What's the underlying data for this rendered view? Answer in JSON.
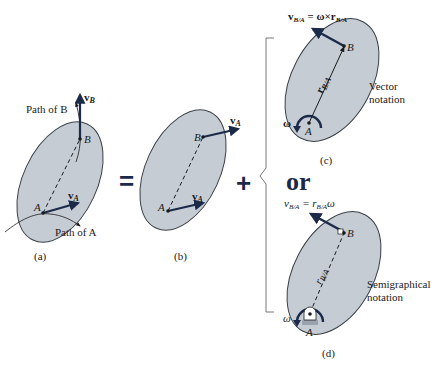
{
  "colors": {
    "body_fill": "#c5ccd4",
    "body_stroke": "#3a3f47",
    "vector": "#1c2a4a",
    "text": "#1a1a1a",
    "bracket": "#555555"
  },
  "panels": {
    "a": {
      "caption": "(a)",
      "path_of_B": "Path of B",
      "path_of_A": "Path of A",
      "point_A": "A",
      "point_B": "B",
      "vB": "v",
      "vB_sub": "B",
      "vA": "v",
      "vA_sub": "A"
    },
    "b": {
      "caption": "(b)",
      "point_A": "A",
      "point_B": "B",
      "vA_top": "v",
      "vA_top_sub": "A",
      "vA_bottom": "v",
      "vA_bottom_sub": "A"
    },
    "c": {
      "caption": "(c)",
      "equation": "v",
      "equation_sub": "B/A",
      "equation_rest": " = ω×r",
      "equation_rest_sub": "B/A",
      "r_label": "r",
      "r_label_sub": "B/A",
      "omega": "ω",
      "point_A": "A",
      "point_B": "B",
      "note_line1": "Vector",
      "note_line2": "notation"
    },
    "d": {
      "caption": "(d)",
      "equation": "v",
      "equation_sub": "B/A",
      "equation_mid": " = r",
      "equation_mid_sub": "B/A",
      "equation_end": "ω",
      "r_label": "r",
      "r_label_sub": "B/A",
      "omega": "ω",
      "point_A": "A",
      "point_B": "B",
      "note_line1": "Semigraphical",
      "note_line2": "notation"
    }
  },
  "operators": {
    "equals": "=",
    "plus": "+",
    "or": "or"
  }
}
